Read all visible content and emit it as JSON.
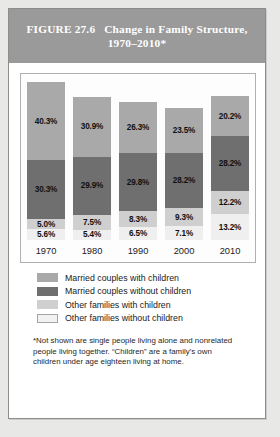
{
  "header": {
    "figure_number": "FIGURE 27.6",
    "title": "Change in Family Structure, 1970–2010*"
  },
  "footnote": "*Not shown are single people living alone and nonrelated people living together. “Children” are a family’s own children under age eighteen living at home.",
  "legend": {
    "items": [
      {
        "label": "Married couples with children",
        "color": "#a9a9a9"
      },
      {
        "label": "Married couples without children",
        "color": "#6f6f6f"
      },
      {
        "label": "Other families with children",
        "color": "#cfcfcf"
      },
      {
        "label": "Other families without children",
        "color": "#efefef"
      }
    ]
  },
  "chart_data": {
    "type": "bar",
    "stacked": true,
    "xlabel": "",
    "ylabel": "",
    "grid": false,
    "legend_position": "bottom",
    "value_unit": "percent",
    "stack_order_top_to_bottom": [
      "Married couples with children",
      "Married couples without children",
      "Other families with children",
      "Other families without children"
    ],
    "categories": [
      "1970",
      "1980",
      "1990",
      "2000",
      "2010"
    ],
    "series": [
      {
        "name": "Married couples with children",
        "color": "#a9a9a9",
        "values": [
          40.3,
          30.9,
          26.3,
          23.5,
          20.2
        ],
        "labels": [
          "40.3%",
          "30.9%",
          "26.3%",
          "23.5%",
          "20.2%"
        ]
      },
      {
        "name": "Married couples without children",
        "color": "#6f6f6f",
        "values": [
          30.3,
          29.9,
          29.8,
          28.2,
          28.2
        ],
        "labels": [
          "30.3%",
          "29.9%",
          "29.8%",
          "28.2%",
          "28.2%"
        ]
      },
      {
        "name": "Other families with children",
        "color": "#cfcfcf",
        "values": [
          5.0,
          7.5,
          8.3,
          9.3,
          12.2
        ],
        "labels": [
          "5.0%",
          "7.5%",
          "8.3%",
          "9.3%",
          "12.2%"
        ]
      },
      {
        "name": "Other families without children",
        "color": "#efefef",
        "values": [
          5.6,
          5.4,
          6.5,
          7.1,
          13.2
        ],
        "labels": [
          "5.6%",
          "5.4%",
          "6.5%",
          "7.1%",
          "13.2%"
        ]
      }
    ],
    "totals": [
      81.2,
      73.7,
      70.9,
      68.1,
      73.8
    ]
  }
}
